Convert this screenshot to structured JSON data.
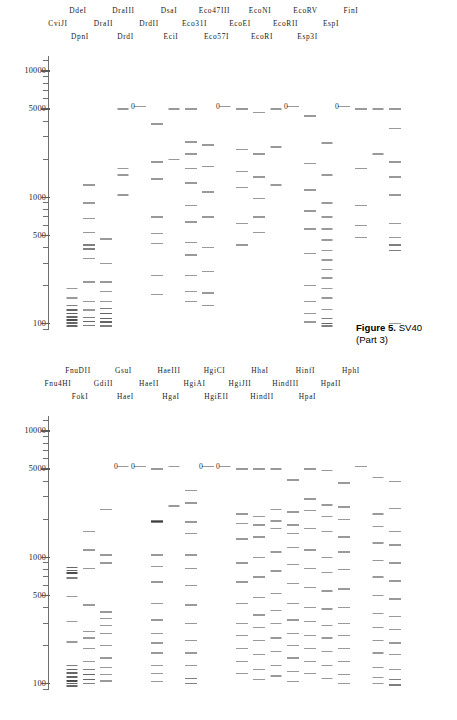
{
  "figure": {
    "caption_label": "Figure 5.",
    "caption_subject": "SV40",
    "part3": "(Part 3)",
    "part4": "(Part 4)"
  },
  "axis": {
    "tick_labels": [
      "10000",
      "5000",
      "1000",
      "500",
      "100"
    ],
    "scale": "log",
    "units": "bp"
  },
  "panel_top": {
    "name": "SV40 Part 3",
    "header_rows": [
      [
        "DdeI",
        "DraIII",
        "DsaI",
        "Eco47III",
        "EcoNI",
        "EcoRV",
        "FinI"
      ],
      [
        "CviJI",
        "DraII",
        "DrdII",
        "Eco31I",
        "EcoEI",
        "EcoRII",
        "EspI"
      ],
      [
        "DpnI",
        "DrdI",
        "EciI",
        "Eco57I",
        "EcoRI",
        "Esp3I"
      ]
    ],
    "lanes": [
      {
        "name": "CviJI",
        "zero": false
      },
      {
        "name": "DdeI",
        "zero": false
      },
      {
        "name": "DpnI",
        "zero": false
      },
      {
        "name": "DraII",
        "zero": false
      },
      {
        "name": "DraIII",
        "zero": true
      },
      {
        "name": "DrdI",
        "zero": false
      },
      {
        "name": "DrdII",
        "zero": false
      },
      {
        "name": "DsaI",
        "zero": false
      },
      {
        "name": "EciI",
        "zero": false
      },
      {
        "name": "Eco31I",
        "zero": true
      },
      {
        "name": "Eco47III",
        "zero": false
      },
      {
        "name": "Eco57I",
        "zero": false
      },
      {
        "name": "EcoEI",
        "zero": false
      },
      {
        "name": "EcoNI",
        "zero": true
      },
      {
        "name": "EcoRI",
        "zero": false
      },
      {
        "name": "EcoRII",
        "zero": false
      },
      {
        "name": "EcoRV",
        "zero": true
      },
      {
        "name": "EspI",
        "zero": false
      },
      {
        "name": "Esp3I",
        "zero": false
      },
      {
        "name": "FinI",
        "zero": false
      }
    ]
  },
  "panel_bottom": {
    "name": "SV40 Part 4",
    "header_rows": [
      [
        "FnuDII",
        "GsuI",
        "HaeIII",
        "HgiCI",
        "HhaI",
        "HinfI",
        "HphI"
      ],
      [
        "Fnu4HI",
        "GdiII",
        "HaeII",
        "HgiAI",
        "HgiJII",
        "HindIII",
        "HpaII"
      ],
      [
        "FokI",
        "HaeI",
        "HgaI",
        "HgiEII",
        "HindII",
        "HpaI"
      ]
    ],
    "lanes": [
      {
        "name": "Fnu4HI",
        "zero": false
      },
      {
        "name": "FnuDII",
        "zero": false
      },
      {
        "name": "FokI",
        "zero": false
      },
      {
        "name": "GdiII",
        "zero": true
      },
      {
        "name": "GsuI",
        "zero": true
      },
      {
        "name": "HaeI",
        "zero": false
      },
      {
        "name": "HaeII",
        "zero": false
      },
      {
        "name": "HaeIII",
        "zero": false
      },
      {
        "name": "HgaI",
        "zero": true
      },
      {
        "name": "HgiAI",
        "zero": true
      },
      {
        "name": "HgiCI",
        "zero": false
      },
      {
        "name": "HgiEII",
        "zero": false
      },
      {
        "name": "HgiJII",
        "zero": false
      },
      {
        "name": "HhaI",
        "zero": false
      },
      {
        "name": "HindII",
        "zero": false
      },
      {
        "name": "HindIII",
        "zero": false
      },
      {
        "name": "HinfI",
        "zero": false
      },
      {
        "name": "HpaI",
        "zero": false
      },
      {
        "name": "HpaII",
        "zero": false
      },
      {
        "name": "HphI",
        "zero": false
      }
    ]
  },
  "chart_data": {
    "type": "scatter",
    "ylabel": "Fragment length (bp)",
    "xlabel": "",
    "yscale": "log",
    "ylim": [
      85,
      14000
    ],
    "ytick_labels": [
      "10000",
      "5000",
      "1000",
      "500",
      "100"
    ],
    "ytick_values": [
      10000,
      5000,
      1000,
      500,
      100
    ],
    "grid": false,
    "legend": "none",
    "panels": [
      {
        "title": "Figure 5. SV40 (Part 3)",
        "x_categories": [
          "CviJI",
          "DdeI",
          "DpnI",
          "DraII",
          "DraIII",
          "DrdI",
          "DrdII",
          "DsaI",
          "EciI",
          "Eco31I",
          "Eco47III",
          "Eco57I",
          "EcoEI",
          "EcoNI",
          "EcoRI",
          "EcoRII",
          "EcoRV",
          "EspI",
          "Esp3I",
          "FinI"
        ],
        "series": [
          {
            "name": "CviJI",
            "values": [
              190,
              160,
              140,
              128,
              120,
              113,
              107,
              101,
              96
            ]
          },
          {
            "name": "DdeI",
            "values": [
              1250,
              900,
              680,
              530,
              420,
              390,
              330,
              215,
              150,
              128,
              112,
              104,
              97
            ]
          },
          {
            "name": "DpnI",
            "values": [
              470,
              300,
              215,
              180,
              150,
              132,
              120,
              110,
              103,
              96
            ]
          },
          {
            "name": "DraII",
            "values": [
              5000,
              1700,
              1500,
              1050
            ]
          },
          {
            "name": "DraIII",
            "values": [
              5243
            ]
          },
          {
            "name": "DrdI",
            "values": [
              3800,
              1900,
              1400,
              700,
              520,
              430,
              240,
              170
            ]
          },
          {
            "name": "DrdII",
            "values": [
              5000,
              2000
            ]
          },
          {
            "name": "DsaI",
            "values": [
              5000,
              2750,
              2200,
              1700,
              1300,
              860,
              640,
              440,
              350,
              240,
              180,
              150
            ]
          },
          {
            "name": "EciI",
            "values": [
              2600,
              1750,
              1100,
              700,
              400,
              260,
              175,
              140
            ]
          },
          {
            "name": "Eco31I",
            "values": [
              5243
            ]
          },
          {
            "name": "Eco47III",
            "values": [
              5000,
              2400,
              1600,
              1200,
              620,
              420
            ]
          },
          {
            "name": "Eco57I",
            "values": [
              4700,
              2200,
              1450,
              980,
              700,
              530
            ]
          },
          {
            "name": "EcoEI",
            "values": [
              5000,
              2500,
              1250
            ]
          },
          {
            "name": "EcoNI",
            "values": [
              5243
            ]
          },
          {
            "name": "EcoRI",
            "values": [
              4400,
              1850,
              1150,
              780,
              560,
              360,
              200,
              150,
              120,
              103
            ]
          },
          {
            "name": "EcoRII",
            "values": [
              2700,
              1500,
              900,
              700,
              560,
              460,
              380,
              320,
              270,
              230,
              190,
              160,
              130,
              110,
              100,
              96
            ]
          },
          {
            "name": "EcoRV",
            "values": [
              5243
            ]
          },
          {
            "name": "EspI",
            "values": [
              5000,
              1700,
              860,
              600,
              480
            ]
          },
          {
            "name": "Esp3I",
            "values": [
              5000,
              2200
            ]
          },
          {
            "name": "FinI",
            "values": [
              5000,
              3500,
              1900,
              1450,
              1050,
              620,
              480,
              420,
              380,
              100
            ]
          }
        ]
      },
      {
        "title": "Figure 5. SV40 (Part 4)",
        "x_categories": [
          "Fnu4HI",
          "FnuDII",
          "FokI",
          "GdiII",
          "GsuI",
          "HaeI",
          "HaeII",
          "HaeIII",
          "HgaI",
          "HgiAI",
          "HgiCI",
          "HgiEII",
          "HgiJII",
          "HhaI",
          "HindII",
          "HindIII",
          "HinfI",
          "HpaI",
          "HpaII",
          "HphI"
        ],
        "series": [
          {
            "name": "Fnu4HI",
            "values": [
              830,
              790,
              760,
              690,
              490,
              310,
              215,
              140,
              130,
              122,
              113,
              105,
              100,
              96
            ]
          },
          {
            "name": "FnuDII",
            "values": [
              1600,
              1150,
              820,
              420,
              260,
              230,
              190,
              150,
              130,
              118,
              108,
              100
            ]
          },
          {
            "name": "FokI",
            "values": [
              2400,
              1050,
              900,
              370,
              330,
              290,
              250,
              200,
              160,
              135,
              118,
              105
            ]
          },
          {
            "name": "GdiII",
            "values": [
              5243
            ]
          },
          {
            "name": "GsuI",
            "values": [
              5243
            ]
          },
          {
            "name": "HaeI",
            "values": [
              5000,
              1950,
              1900,
              1050,
              850,
              640,
              430,
              320,
              250,
              210,
              175,
              140,
              120,
              104
            ]
          },
          {
            "name": "HaeII",
            "values": [
              5243,
              2550
            ]
          },
          {
            "name": "HaeIII",
            "values": [
              3400,
              2700,
              1900,
              1550,
              1050,
              820,
              600,
              420,
              300,
              220,
              175,
              140,
              110,
              100
            ]
          },
          {
            "name": "HgaI",
            "values": [
              5243
            ]
          },
          {
            "name": "HgiAI",
            "values": [
              5243
            ]
          },
          {
            "name": "HgiCI",
            "values": [
              5000,
              2200,
              1850,
              1400,
              900,
              640,
              430,
              300,
              240,
              190,
              150,
              120
            ]
          },
          {
            "name": "HgiEII",
            "values": [
              5000,
              2100,
              1800,
              1450,
              1000,
              700,
              480,
              350,
              280,
              220,
              170,
              130,
              108
            ]
          },
          {
            "name": "HgiJII",
            "values": [
              5000,
              2400,
              1950,
              1700,
              1100,
              780,
              520,
              380,
              300,
              230,
              180,
              140,
              115
            ]
          },
          {
            "name": "HhaI",
            "values": [
              4100,
              2300,
              1800,
              1550,
              1200,
              880,
              620,
              430,
              320,
              250,
              200,
              160,
              125,
              104
            ]
          },
          {
            "name": "HindII",
            "values": [
              5000,
              2900,
              2350,
              1700,
              1150,
              820,
              580,
              400,
              310,
              240,
              190,
              150,
              120
            ]
          },
          {
            "name": "HindIII",
            "values": [
              4900,
              2600,
              2100,
              1600,
              1000,
              760,
              540,
              390,
              290,
              230,
              180,
              140,
              110
            ]
          },
          {
            "name": "HinfI",
            "values": [
              3900,
              2500,
              2000,
              1450,
              1100,
              800,
              560,
              400,
              300,
              240,
              190,
              150,
              118,
              100
            ]
          },
          {
            "name": "HpaI",
            "values": [
              5243
            ]
          },
          {
            "name": "HpaII",
            "values": [
              4300,
              2200,
              1750,
              1300,
              950,
              700,
              500,
              360,
              280,
              220,
              175,
              135,
              112,
              100
            ]
          },
          {
            "name": "HphI",
            "values": [
              4000,
              2450,
              1600,
              1250,
              900,
              650,
              470,
              340,
              270,
              210,
              170,
              130,
              108,
              98
            ]
          }
        ]
      }
    ]
  }
}
